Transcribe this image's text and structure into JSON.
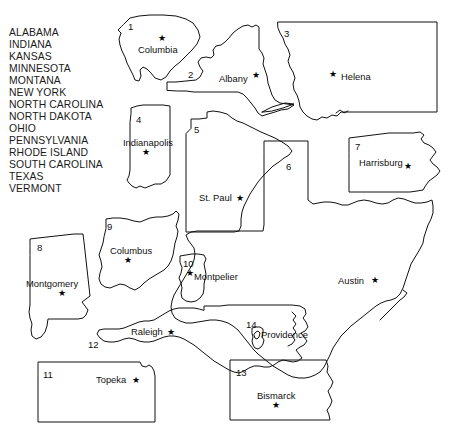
{
  "page": {
    "background_color": "#ffffff",
    "outline_color": "#111111",
    "text_color": "#1a1a1a"
  },
  "state_list": {
    "name": "state-name-word-bank",
    "items": [
      "ALABAMA",
      "INDIANA",
      "KANSAS",
      "MINNESOTA",
      "MONTANA",
      "NEW YORK",
      "NORTH CAROLINA",
      "NORTH DAKOTA",
      "OHIO",
      "PENNSYLVANIA",
      "RHODE ISLAND",
      "SOUTH CAROLINA",
      "TEXAS",
      "VERMONT"
    ]
  },
  "map": {
    "shapes": [
      {
        "number": "1",
        "capital": "Columbia",
        "state": "SOUTH CAROLINA"
      },
      {
        "number": "2",
        "capital": "Albany",
        "state": "NEW YORK"
      },
      {
        "number": "3",
        "capital": "Helena",
        "state": "MONTANA"
      },
      {
        "number": "4",
        "capital": "Indianapolis",
        "state": "INDIANA"
      },
      {
        "number": "5",
        "capital": "St. Paul",
        "state": "MINNESOTA"
      },
      {
        "number": "6",
        "capital": "Austin",
        "state": "TEXAS"
      },
      {
        "number": "7",
        "capital": "Harrisburg",
        "state": "PENNSYLVANIA"
      },
      {
        "number": "8",
        "capital": "Montgomery",
        "state": "ALABAMA"
      },
      {
        "number": "9",
        "capital": "Columbus",
        "state": "OHIO"
      },
      {
        "number": "10",
        "capital": "Montpelier",
        "state": "VERMONT"
      },
      {
        "number": "11",
        "capital": "Topeka",
        "state": "KANSAS"
      },
      {
        "number": "12",
        "capital": "Raleigh",
        "state": "NORTH CAROLINA"
      },
      {
        "number": "13",
        "capital": "Bismarck",
        "state": "NORTH DAKOTA"
      },
      {
        "number": "14",
        "capital": "Providence",
        "state": "RHODE ISLAND"
      }
    ],
    "star_glyph": "★"
  }
}
